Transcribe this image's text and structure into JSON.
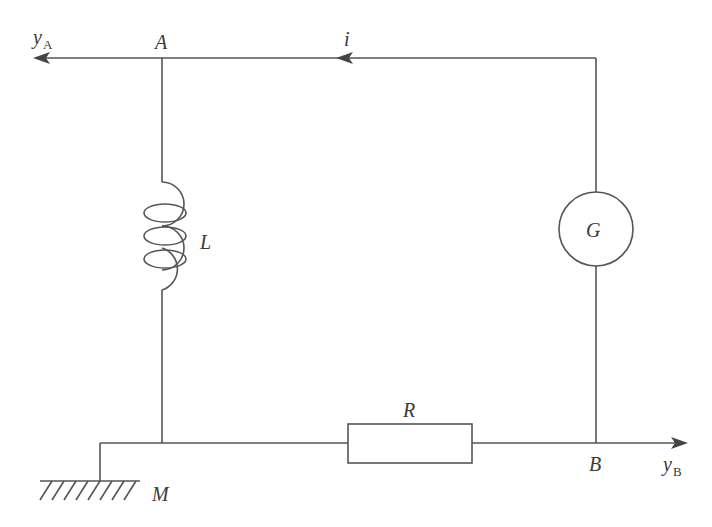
{
  "diagram": {
    "type": "circuit",
    "nodes": {
      "A": "A",
      "B": "B",
      "M": "M"
    },
    "components": {
      "inductor": "L",
      "generator": "G",
      "resistor": "R"
    },
    "current_label": "i",
    "outputs": {
      "yA": {
        "main": "y",
        "sub": "A"
      },
      "yB": {
        "main": "y",
        "sub": "B"
      }
    },
    "colors": {
      "line": "#555555",
      "text": "#3a3a3a"
    }
  }
}
